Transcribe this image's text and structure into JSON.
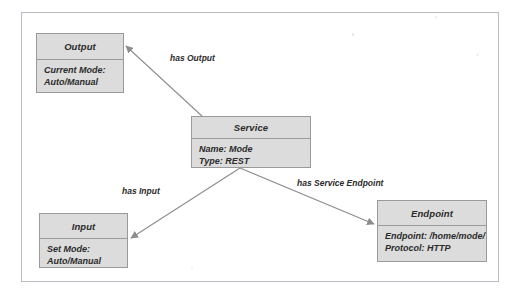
{
  "diagram": {
    "background_color": "#ffffff",
    "frame_color": "#b9bcc2",
    "box_fill_color": "#dcdcdc",
    "box_border_color": "#9a9a9a",
    "edge_color": "#8d8d8d",
    "text_color": "#2b2b2b",
    "classes": [
      {
        "id": "output",
        "name": "Output",
        "attributes": [
          "Current Mode:",
          "Auto/Manual"
        ]
      },
      {
        "id": "service",
        "name": "Service",
        "attributes": [
          "Name: Mode",
          "Type: REST"
        ]
      },
      {
        "id": "input",
        "name": "Input",
        "attributes": [
          "Set Mode:",
          "Auto/Manual"
        ]
      },
      {
        "id": "endpoint",
        "name": "Endpoint",
        "attributes": [
          "Endpoint: /home/mode/",
          "Protocol: HTTP"
        ]
      }
    ],
    "relations": [
      {
        "id": "has-output",
        "label": "has Output",
        "from": "service",
        "to": "output"
      },
      {
        "id": "has-input",
        "label": "has Input",
        "from": "service",
        "to": "input"
      },
      {
        "id": "has-service-endpoint",
        "label": "has Service Endpoint",
        "from": "service",
        "to": "endpoint"
      }
    ]
  }
}
